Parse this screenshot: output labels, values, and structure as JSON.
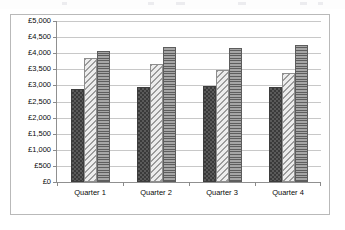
{
  "chart_data": {
    "type": "bar",
    "title": "",
    "subtitle": "",
    "xlabel": "",
    "ylabel": "",
    "categories": [
      "Quarter 1",
      "Quarter 2",
      "Quarter 3",
      "Quarter 4"
    ],
    "series": [
      {
        "name": "Series 1",
        "pattern": "checkerboard",
        "color": "#4a4a4a",
        "values": [
          2900,
          2950,
          2980,
          2950
        ]
      },
      {
        "name": "Series 2",
        "pattern": "diagonal-hatch",
        "color": "#d9d9d9",
        "values": [
          3850,
          3670,
          3480,
          3380
        ]
      },
      {
        "name": "Series 3",
        "pattern": "horizontal-lines",
        "color": "#8e8e8e",
        "values": [
          4080,
          4180,
          4170,
          4270
        ]
      }
    ],
    "ylim": [
      0,
      5000
    ],
    "ytick_step": 500,
    "ytick_labels": [
      "£5,000",
      "£4,500",
      "£4,000",
      "£3,500",
      "£3,000",
      "£2,500",
      "£2,000",
      "£1,500",
      "£1,000",
      "£500",
      "£0"
    ],
    "ytick_values": [
      5000,
      4500,
      4000,
      3500,
      3000,
      2500,
      2000,
      1500,
      1000,
      500,
      0
    ],
    "currency_symbol": "£",
    "grid": true,
    "grid_axis": "y",
    "legend": false,
    "legend_position": "none",
    "plot_background": "#ffffff",
    "grid_color": "#c8c8c8",
    "axis_color": "#909090",
    "border_color": "#b9b9b9"
  }
}
